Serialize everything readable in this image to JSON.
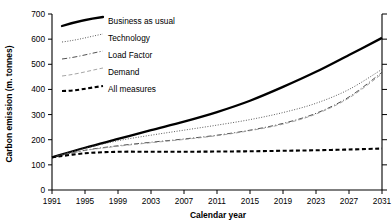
{
  "chart_data": {
    "type": "line",
    "title": "",
    "xlabel": "Calendar year",
    "ylabel": "Carbon emission (m. tonnes)",
    "xlim": [
      1991,
      2031
    ],
    "ylim": [
      0,
      700
    ],
    "xticks": [
      1991,
      1995,
      1999,
      2003,
      2007,
      2011,
      2015,
      2019,
      2023,
      2027,
      2031
    ],
    "yticks": [
      0,
      100,
      200,
      300,
      400,
      500,
      600,
      700
    ],
    "grid": false,
    "legend_position": "top-left-inside",
    "x": [
      1991,
      1995,
      1999,
      2003,
      2007,
      2011,
      2015,
      2019,
      2023,
      2027,
      2031
    ],
    "series": [
      {
        "name": "Business as usual",
        "style": "solid-thick",
        "values": [
          130,
          168,
          203,
          238,
          272,
          310,
          355,
          410,
          470,
          537,
          605
        ]
      },
      {
        "name": "Technology",
        "style": "dotted",
        "values": [
          130,
          166,
          196,
          218,
          238,
          258,
          280,
          308,
          345,
          400,
          480
        ]
      },
      {
        "name": "Load Factor",
        "style": "dash-dot",
        "values": [
          130,
          158,
          176,
          190,
          203,
          218,
          238,
          265,
          305,
          370,
          468
        ]
      },
      {
        "name": "Demand",
        "style": "dashed-faint",
        "values": [
          130,
          157,
          174,
          188,
          201,
          216,
          236,
          262,
          302,
          366,
          462
        ]
      },
      {
        "name": "All measures",
        "style": "dashed-bold",
        "values": [
          130,
          146,
          152,
          152,
          152,
          153,
          154,
          156,
          158,
          161,
          165
        ]
      }
    ]
  },
  "legend": {
    "items": [
      {
        "label": "Business as usual",
        "swatch": "solid-thick"
      },
      {
        "label": "Technology",
        "swatch": "dotted"
      },
      {
        "label": "Load Factor",
        "swatch": "dash-dot"
      },
      {
        "label": "Demand",
        "swatch": "dashed-faint"
      },
      {
        "label": "All measures",
        "swatch": "dashed-bold"
      }
    ]
  },
  "axes": {
    "y_title": "Carbon emission (m. tonnes)",
    "x_title": "Calendar year",
    "y_tick_labels": [
      "0",
      "100",
      "200",
      "300",
      "400",
      "500",
      "600",
      "700"
    ],
    "x_tick_labels": [
      "1991",
      "1995",
      "1999",
      "2003",
      "2007",
      "2011",
      "2015",
      "2019",
      "2023",
      "2027",
      "2031"
    ]
  },
  "colors": {
    "line": "#000000",
    "axis": "#000000",
    "background": "#ffffff",
    "faint": "#9a9a9a"
  },
  "caption": ""
}
